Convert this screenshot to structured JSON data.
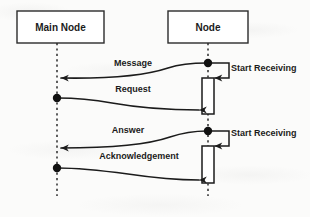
{
  "diagram": {
    "kind": "uml-sequence-diagram",
    "colors": {
      "background": "#fbfbfa",
      "stroke": "#1b1b1b",
      "box_fill": "#ffffff",
      "lifeline": "#2b2b2b"
    },
    "lifelines": [
      {
        "id": "main-node",
        "label": "Main Node",
        "box": {
          "x": 17,
          "y": 11,
          "w": 87,
          "h": 32
        },
        "axis_x": 57,
        "axis_bottom": 196
      },
      {
        "id": "node",
        "label": "Node",
        "box": {
          "x": 168,
          "y": 11,
          "w": 80,
          "h": 32
        },
        "axis_x": 208,
        "axis_bottom": 196
      }
    ],
    "messages": [
      {
        "id": "message",
        "label": "Message",
        "from": "node",
        "to": "main-node",
        "direction": "right-to-left",
        "label_pos": {
          "x": 133,
          "y": 64
        },
        "from_point": {
          "x": 208,
          "y": 63
        },
        "to_point": {
          "x": 59,
          "y": 78
        }
      },
      {
        "id": "request",
        "label": "Request",
        "from": "main-node",
        "to": "node",
        "direction": "left-to-right",
        "label_pos": {
          "x": 133,
          "y": 90
        },
        "from_point": {
          "x": 57,
          "y": 98
        },
        "to_point": {
          "x": 202,
          "y": 110
        }
      },
      {
        "id": "answer",
        "label": "Answer",
        "from": "node",
        "to": "main-node",
        "direction": "right-to-left",
        "label_pos": {
          "x": 128,
          "y": 131
        },
        "from_point": {
          "x": 208,
          "y": 131
        },
        "to_point": {
          "x": 59,
          "y": 148
        }
      },
      {
        "id": "acknowledgement",
        "label": "Acknowledgement",
        "from": "main-node",
        "to": "node",
        "direction": "left-to-right",
        "label_pos": {
          "x": 139,
          "y": 157
        },
        "from_point": {
          "x": 57,
          "y": 168
        },
        "to_point": {
          "x": 202,
          "y": 180
        }
      }
    ],
    "self_messages": [
      {
        "id": "start-receiving-1",
        "label": "Start Receiving",
        "on": "node",
        "label_pos": {
          "x": 231,
          "y": 69
        },
        "start_point": {
          "x": 208,
          "y": 63
        },
        "right_x": 229,
        "return_y": 78,
        "arrow_x": 212
      },
      {
        "id": "start-receiving-2",
        "label": "Start Receiving",
        "on": "node",
        "label_pos": {
          "x": 231,
          "y": 134
        },
        "start_point": {
          "x": 208,
          "y": 131
        },
        "right_x": 229,
        "return_y": 146,
        "arrow_x": 212
      }
    ],
    "activations": [
      {
        "id": "activation-1",
        "on": "node",
        "x": 202,
        "y": 78,
        "w": 12,
        "h": 36
      },
      {
        "id": "activation-2",
        "on": "node",
        "x": 202,
        "y": 146,
        "w": 12,
        "h": 37
      }
    ],
    "origin_dots": [
      {
        "id": "dot-node-message",
        "x": 208,
        "y": 63,
        "r": 4.2
      },
      {
        "id": "dot-main-request",
        "x": 57,
        "y": 98,
        "r": 4.2
      },
      {
        "id": "dot-node-answer",
        "x": 208,
        "y": 131,
        "r": 4.2
      },
      {
        "id": "dot-main-acknowledgement",
        "x": 57,
        "y": 168,
        "r": 4.2
      }
    ]
  }
}
